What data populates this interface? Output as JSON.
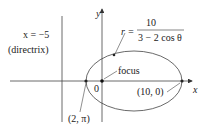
{
  "directrix": {
    "equation": "x = −5",
    "label": "(directrix)"
  },
  "axes": {
    "x_label": "x",
    "y_label": "y"
  },
  "equation": {
    "lhs": "r =",
    "numerator": "10",
    "denominator": "3 − 2 cos θ"
  },
  "points": {
    "focus": {
      "label": "focus"
    },
    "origin": {
      "label": "0"
    },
    "left_vertex": {
      "label": "(2, π)"
    },
    "right_vertex": {
      "label": "(10, 0)"
    }
  },
  "colors": {
    "stroke": "#333333",
    "background": "#ffffff"
  }
}
